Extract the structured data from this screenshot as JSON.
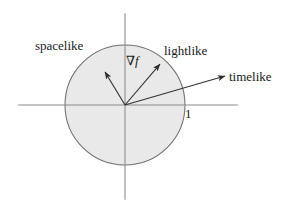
{
  "figure": {
    "background_color": "#ffffff",
    "axis_color": "#8a8a8a",
    "circle_stroke_color": "#6f6f6f",
    "disk_fill_color": "#e9e9e9",
    "arrow_color": "#333333",
    "text_color": "#1a1a1a",
    "labels": {
      "spacelike": "spacelike",
      "lightlike": "lightlike",
      "timelike": "timelike",
      "gradient_nabla": "∇",
      "gradient_f": "f",
      "unit_tick": "1"
    },
    "icons": {
      "spacelike_arrow": "arrow-up-left-icon",
      "lightlike_arrow": "arrow-up-right-icon",
      "timelike_arrow": "arrow-right-up-icon",
      "unit_circle": "circle-icon",
      "horizontal_axis": "axis-horizontal-icon",
      "vertical_axis": "axis-vertical-icon"
    }
  },
  "chart_data": {
    "type": "scatter",
    "xlabel": "",
    "ylabel": "",
    "xlim": [
      -2.1,
      1.9
    ],
    "ylim": [
      -1.55,
      1.55
    ],
    "grid": false,
    "legend": "none",
    "geometry": {
      "origin": {
        "x": 125,
        "y": 105
      },
      "unit_radius_px": 60,
      "unit_circle": {
        "center": [
          0,
          0
        ],
        "radius": 1,
        "label": "1",
        "label_point": [
          1,
          0
        ],
        "fill": "#e9e9e9",
        "stroke": "#6f6f6f"
      },
      "axes": {
        "horizontal": {
          "from": [
            -1.78,
            0
          ],
          "to": [
            1.88,
            0
          ]
        },
        "vertical": {
          "from": [
            0,
            1.53
          ],
          "to": [
            0,
            -1.58
          ]
        }
      }
    },
    "vectors": [
      {
        "name": "spacelike",
        "label": "spacelike",
        "from": [
          0,
          0
        ],
        "to": [
          -0.333,
          0.55
        ],
        "length": 0.643,
        "inside_unit_circle": true,
        "label_anchor": [
          -1.5,
          1.1
        ]
      },
      {
        "name": "gradient",
        "label": "∇f",
        "from": [
          0,
          0
        ],
        "to": [
          0.583,
          0.683
        ],
        "length": 0.898,
        "inside_unit_circle": true,
        "label_anchor": [
          0.02,
          0.85
        ]
      },
      {
        "name": "lightlike",
        "label": "lightlike",
        "from": [
          0,
          0
        ],
        "to": [
          0.583,
          0.683
        ],
        "on_unit_circle": false,
        "label_anchor": [
          0.65,
          1.02
        ]
      },
      {
        "name": "timelike",
        "label": "timelike",
        "from": [
          0,
          0
        ],
        "to": [
          1.667,
          0.483
        ],
        "length": 1.736,
        "outside_unit_circle": true,
        "label_anchor": [
          1.73,
          0.58
        ]
      }
    ],
    "annotations": [
      {
        "text": "spacelike",
        "x": -1.5,
        "y": 1.1
      },
      {
        "text": "lightlike",
        "x": 0.65,
        "y": 1.02
      },
      {
        "text": "timelike",
        "x": 1.73,
        "y": 0.58
      },
      {
        "text": "∇f",
        "x": 0.02,
        "y": 0.85
      },
      {
        "text": "1",
        "x": 1.0,
        "y": -0.14
      }
    ]
  }
}
